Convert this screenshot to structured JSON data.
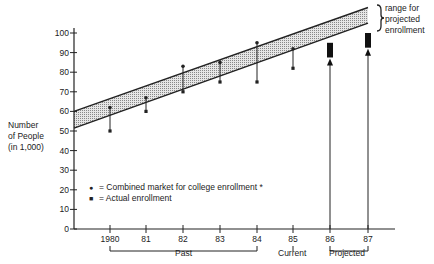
{
  "chart_data": {
    "type": "line",
    "title": "",
    "xlabel": "",
    "ylabel": "Number of People (in 1,000)",
    "ylim": [
      0,
      100
    ],
    "yticks": [
      0,
      10,
      20,
      30,
      40,
      50,
      60,
      70,
      80,
      90,
      100
    ],
    "categories": [
      "1980",
      "81",
      "82",
      "83",
      "84",
      "85",
      "86",
      "87"
    ],
    "series": [
      {
        "name": "Combined market for college enrollment *",
        "marker": "dot",
        "values": [
          62,
          67,
          83,
          85,
          95,
          92,
          null,
          null
        ]
      },
      {
        "name": "Actual enrollment",
        "marker": "square",
        "values": [
          50,
          60,
          70,
          75,
          75,
          82,
          null,
          null
        ]
      }
    ],
    "trend_band": {
      "start": {
        "x": "axis",
        "lower": 51.5,
        "upper": 60
      },
      "end": {
        "x": "87",
        "lower": 105,
        "upper": 113
      }
    },
    "projected_ranges": [
      {
        "x": "86",
        "low": 87,
        "high": 95
      },
      {
        "x": "87",
        "low": 92,
        "high": 100
      }
    ],
    "groups": [
      {
        "label": "Past",
        "from": "1980",
        "to": "84"
      },
      {
        "label": "Current",
        "at": "85"
      },
      {
        "label": "Projected",
        "from": "86",
        "to": "87"
      }
    ],
    "annotations": [
      "range for projected enrollment"
    ],
    "grid": false,
    "legend_position": "inside-lower-left"
  },
  "labels": {
    "ylabel_lines": [
      "Number",
      "of People",
      "(in 1,000)"
    ],
    "legend": [
      {
        "symbol": "●",
        "text": "= Combined market for college enrollment *"
      },
      {
        "symbol": "■",
        "text": "= Actual enrollment"
      }
    ],
    "range_note_lines": [
      "range for",
      "projected",
      "enrollment"
    ],
    "group_past": "Past",
    "group_current": "Current",
    "group_projected": "Projected"
  }
}
